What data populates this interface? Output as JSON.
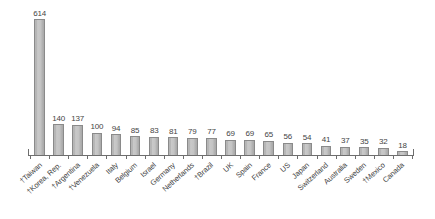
{
  "chart_data": {
    "type": "bar",
    "title": "",
    "subtitle": "",
    "xlabel": "",
    "ylabel": "",
    "ylim": [
      0,
      614
    ],
    "grid": false,
    "legend": null,
    "orientation": "vertical",
    "value_labels_shown": true,
    "categories": [
      "†Taiwan",
      "†Korea, Rep.",
      "†Argentina",
      "†Venezuela",
      "Italy",
      "Belgium",
      "Israel",
      "Germany",
      "Netherlands",
      "†Brazil",
      "UK",
      "Spain",
      "France",
      "US",
      "Japan",
      "Switzerland",
      "Australia",
      "Sweden",
      "†Mexico",
      "Canada"
    ],
    "values": [
      614,
      140,
      137,
      100,
      94,
      85,
      83,
      81,
      79,
      77,
      69,
      69,
      65,
      56,
      54,
      41,
      37,
      35,
      32,
      18
    ],
    "value_label_texts": [
      "614",
      "140",
      "137",
      "100",
      "94",
      "85",
      "83",
      "81",
      "79",
      "77",
      "69",
      "69",
      "65",
      "56",
      "54",
      "41",
      "37",
      "35",
      "32",
      "18"
    ],
    "bar_fill_color": "#c2c2c2",
    "bar_border_color": "#8a8a8a",
    "axis_color": "#6e6e6e",
    "text_color": "#3f3f3f",
    "background_color": "#ffffff"
  }
}
